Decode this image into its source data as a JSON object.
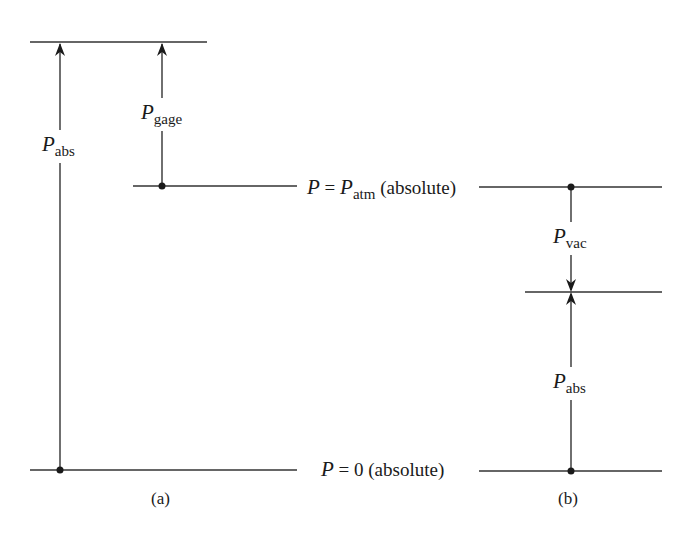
{
  "diagram": {
    "type": "pressure-reference-levels",
    "panels": [
      {
        "id": "a",
        "caption": "(a)",
        "labels": {
          "p_abs": {
            "symbol": "P",
            "subscript": "abs"
          },
          "p_gage": {
            "symbol": "P",
            "subscript": "gage"
          }
        }
      },
      {
        "id": "b",
        "caption": "(b)",
        "labels": {
          "p_vac": {
            "symbol": "P",
            "subscript": "vac"
          },
          "p_abs": {
            "symbol": "P",
            "subscript": "abs"
          }
        }
      }
    ],
    "levels": {
      "atm": {
        "lhs": "P = ",
        "symbol": "P",
        "subscript": "atm",
        "suffix": " (absolute)"
      },
      "zero": {
        "symbol": "P",
        "text": " = 0 (absolute)"
      }
    },
    "colors": {
      "line": "#333333",
      "background": "#ffffff"
    }
  }
}
